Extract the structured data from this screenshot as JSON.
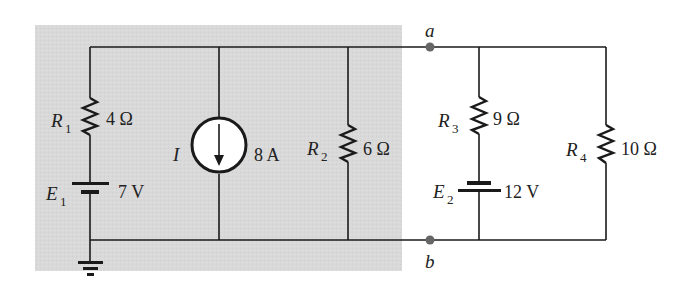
{
  "diagram": {
    "type": "circuit-schematic",
    "shaded_region": {
      "color": "#dcdcdc",
      "description": "left network enclosed in gray box"
    },
    "wire_color": "#1a1a1a",
    "node_color": "#666666",
    "components": {
      "R1": {
        "symbol": "R",
        "subscript": "1",
        "value": "4 Ω"
      },
      "E1": {
        "symbol": "E",
        "subscript": "1",
        "value": "7 V"
      },
      "I": {
        "symbol": "I",
        "subscript": "",
        "value": "8 A",
        "direction": "down"
      },
      "R2": {
        "symbol": "R",
        "subscript": "2",
        "value": "6 Ω"
      },
      "R3": {
        "symbol": "R",
        "subscript": "3",
        "value": "9 Ω"
      },
      "E2": {
        "symbol": "E",
        "subscript": "2",
        "value": "12 V"
      },
      "R4": {
        "symbol": "R",
        "subscript": "4",
        "value": "10 Ω"
      }
    },
    "nodes": {
      "a": {
        "label": "a"
      },
      "b": {
        "label": "b"
      }
    },
    "ground": {
      "present": true
    }
  }
}
